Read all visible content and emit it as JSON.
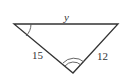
{
  "diagram": {
    "type": "triangle",
    "labels": {
      "top_side": "y",
      "left_side": "15",
      "right_side": "12"
    },
    "angle_marks": {
      "left_vertex": "single arc",
      "bottom_vertex": "double arc"
    },
    "colors": {
      "stroke": "#333333",
      "background": "#ffffff"
    }
  }
}
